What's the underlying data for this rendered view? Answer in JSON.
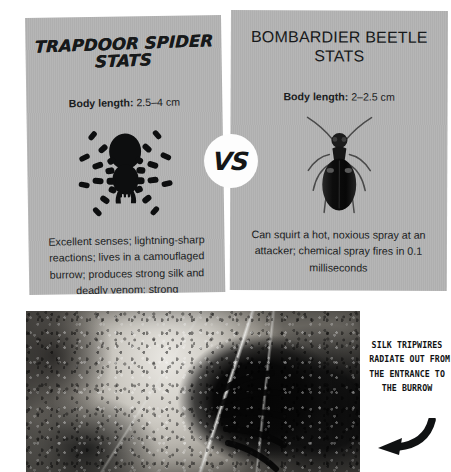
{
  "comparison": {
    "vs_label": "VS",
    "panels": [
      {
        "id": "trapdoor-spider",
        "title": "TRAPDOOR SPIDER STATS",
        "body_length_label": "Body length:",
        "body_length_value": "2.5–4 cm",
        "description": "Excellent senses; lightning-sharp reactions; lives in a camouflaged burrow; produces strong silk and deadly venom; strong",
        "art_icon": "spider-silhouette-icon",
        "background_color": "#b2b2b2"
      },
      {
        "id": "bombardier-beetle",
        "title": "BOMBARDIER BEETLE STATS",
        "body_length_label": "Body length:",
        "body_length_value": "2–2.5 cm",
        "description": "Can squirt a hot, noxious spray at an attacker; chemical spray fires in 0.1 milliseconds",
        "art_icon": "beetle-photo-icon",
        "background_color": "#b2b2b2"
      }
    ]
  },
  "photo": {
    "caption_lines": [
      "SILK TRIPWIRES",
      "RADIATE OUT FROM",
      "THE ENTRANCE TO",
      "THE BURROW"
    ],
    "arrow_icon": "curved-arrow-left-icon",
    "subject": "spider-burrow-photograph"
  },
  "theme": {
    "page_background": "#ffffff",
    "panel_gray": "#b2b2b2",
    "text_dark": "#17191a",
    "badge_white": "#fdfdfd"
  }
}
